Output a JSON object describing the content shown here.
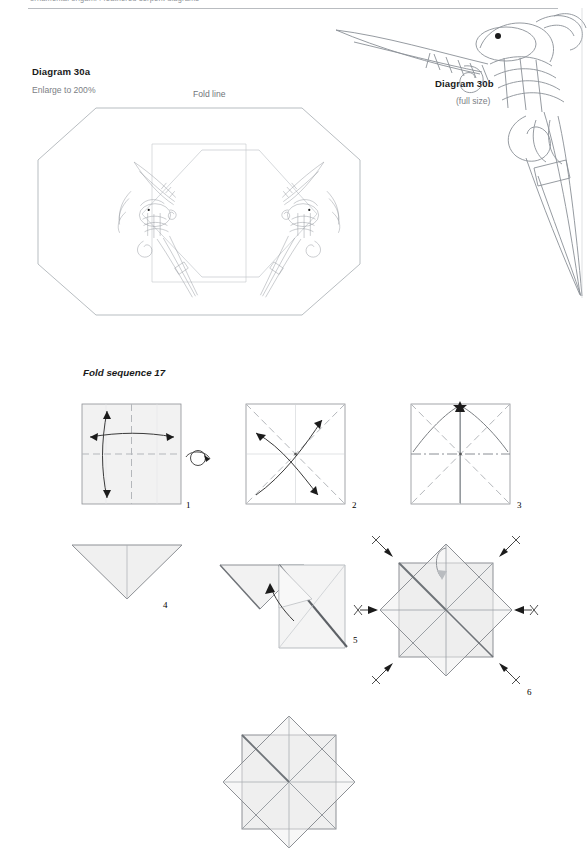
{
  "header": {
    "running_text": "ornamental origami : feathered serpent diagrams"
  },
  "diagram_a": {
    "title": "Diagram 30a",
    "scale_note": "Enlarge to 200%",
    "fold_line_label": "Fold line",
    "motif": "feathered-serpent-head",
    "motif_count": 2,
    "outline": "octagon",
    "inner_shape": "hexagon"
  },
  "diagram_b": {
    "title": "Diagram 30b",
    "scale_note": "(full size)",
    "motif": "feathered-serpent-head",
    "motif_count": 1
  },
  "fold_sequence": {
    "title": "Fold sequence 17",
    "steps": [
      {
        "number": "1",
        "symbols": [
          "valley-fold-vertical",
          "valley-fold-horizontal",
          "arrow-double-horizontal",
          "arrow-double-vertical",
          "turn-over"
        ]
      },
      {
        "number": "2",
        "symbols": [
          "valley-fold-diagonal",
          "valley-fold-diagonal",
          "arrow-double-diagonal",
          "arrow-double-diagonal"
        ]
      },
      {
        "number": "3",
        "symbols": [
          "valley-fold-diagonal",
          "mountain-fold-horizontal",
          "arrow-to-top-corner"
        ]
      },
      {
        "number": "4",
        "symbols": [
          "triangle-folded"
        ]
      },
      {
        "number": "5",
        "symbols": [
          "squash-fold",
          "arrow-curved"
        ]
      },
      {
        "number": "6",
        "symbols": [
          "arrow-inward-x8",
          "x-mark-x8",
          "arrow-loop"
        ]
      },
      {
        "number": "",
        "symbols": [
          "finished-star"
        ]
      }
    ]
  },
  "colors": {
    "paper_fill": "#f2f2f2",
    "paper_edge": "#8d9095",
    "fold_dash": "#b4b7bb",
    "arrow": "#3a3a3a",
    "ink": "#6b7075",
    "label": "#1a1a1a",
    "muted": "#7c8085"
  }
}
